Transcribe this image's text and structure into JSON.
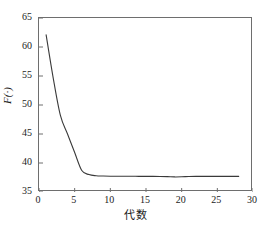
{
  "chart_data": {
    "type": "line",
    "title": "",
    "subtitle": "",
    "xlabel": "代数",
    "ylabel": "F(·)",
    "xlim": [
      0,
      30
    ],
    "ylim": [
      35,
      65
    ],
    "xticks": [
      0,
      5,
      10,
      15,
      20,
      25,
      30
    ],
    "xtick_labels": [
      "0",
      "5",
      "10",
      "15",
      "20",
      "25",
      "30"
    ],
    "yticks": [
      35,
      40,
      45,
      50,
      55,
      60,
      65
    ],
    "ytick_labels": [
      "35",
      "40",
      "45",
      "50",
      "55",
      "60",
      "65"
    ],
    "grid": false,
    "legend": null,
    "legend_position": "none",
    "line_color": "#3a3a3a",
    "frame_color": "#6e6e6e",
    "background_color": "#ffffff",
    "series": [
      {
        "name": "F(·)",
        "x": [
          1,
          2,
          3,
          4,
          5,
          6,
          7,
          8,
          9,
          10,
          11,
          12,
          13,
          14,
          15,
          16,
          17,
          18,
          19,
          20,
          21,
          22,
          23,
          24,
          25,
          26,
          27,
          28
        ],
        "values": [
          62.1,
          54.6,
          48.2,
          45.0,
          41.8,
          38.7,
          38.0,
          37.8,
          37.75,
          37.72,
          37.72,
          37.71,
          37.71,
          37.7,
          37.7,
          37.7,
          37.68,
          37.65,
          37.6,
          37.62,
          37.68,
          37.7,
          37.7,
          37.7,
          37.7,
          37.7,
          37.7,
          37.7
        ]
      }
    ],
    "annotations": []
  }
}
